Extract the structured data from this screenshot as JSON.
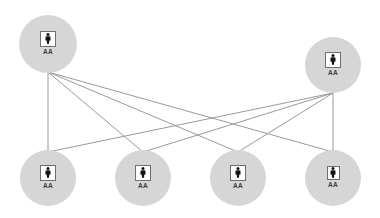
{
  "diagram": {
    "type": "bipartite-network",
    "colors": {
      "node_fill": "#d6d6d6",
      "edge": "#9a9a9a",
      "icon_border": "#6e6e6e",
      "icon_glyph": "#111111",
      "label": "#3a3a3a"
    },
    "nodes": [
      {
        "id": "top-left",
        "label": "AA",
        "icon": "person-icon",
        "cx": 48,
        "cy": 44,
        "r": 29,
        "row": "top"
      },
      {
        "id": "top-right",
        "label": "AA",
        "icon": "person-icon",
        "cx": 333,
        "cy": 65,
        "r": 28,
        "row": "top"
      },
      {
        "id": "bottom-1",
        "label": "AA",
        "icon": "person-icon",
        "cx": 48,
        "cy": 178,
        "r": 28,
        "row": "bottom"
      },
      {
        "id": "bottom-2",
        "label": "AA",
        "icon": "person-icon",
        "cx": 143,
        "cy": 178,
        "r": 28,
        "row": "bottom"
      },
      {
        "id": "bottom-3",
        "label": "AA",
        "icon": "person-icon",
        "cx": 238,
        "cy": 178,
        "r": 28,
        "row": "bottom"
      },
      {
        "id": "bottom-4",
        "label": "AA",
        "icon": "person-icon",
        "cx": 333,
        "cy": 178,
        "r": 28,
        "row": "bottom",
        "small_icon": true
      }
    ],
    "edges": [
      {
        "from": "top-left",
        "to": "bottom-1",
        "x1": 48,
        "y1": 72,
        "x2": 48,
        "y2": 152
      },
      {
        "from": "top-left",
        "to": "bottom-2",
        "x1": 48,
        "y1": 72,
        "x2": 143,
        "y2": 152
      },
      {
        "from": "top-left",
        "to": "bottom-3",
        "x1": 48,
        "y1": 72,
        "x2": 238,
        "y2": 152
      },
      {
        "from": "top-left",
        "to": "bottom-4",
        "x1": 48,
        "y1": 72,
        "x2": 333,
        "y2": 152
      },
      {
        "from": "top-right",
        "to": "bottom-1",
        "x1": 333,
        "y1": 93,
        "x2": 48,
        "y2": 152
      },
      {
        "from": "top-right",
        "to": "bottom-2",
        "x1": 333,
        "y1": 93,
        "x2": 143,
        "y2": 152
      },
      {
        "from": "top-right",
        "to": "bottom-3",
        "x1": 333,
        "y1": 93,
        "x2": 238,
        "y2": 152
      },
      {
        "from": "top-right",
        "to": "bottom-4",
        "x1": 333,
        "y1": 93,
        "x2": 333,
        "y2": 152
      }
    ]
  }
}
